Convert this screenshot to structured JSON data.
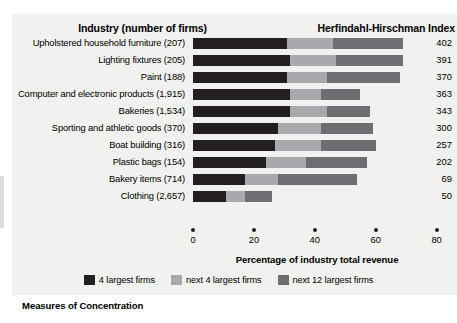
{
  "header": {
    "industry_title": "Industry (number of firms)",
    "index_title": "Herfindahl-Hirschman Index"
  },
  "caption": "Measures of Concentration",
  "axis": {
    "title": "Percentage of industry total revenue",
    "ticks": [
      "0",
      "20",
      "40",
      "60",
      "80"
    ]
  },
  "legend": [
    {
      "label": "4 largest firms",
      "color": "#231f20"
    },
    {
      "label": "next 4 largest firms",
      "color": "#a7a9ac"
    },
    {
      "label": "next 12 largest firms",
      "color": "#6d6e71"
    }
  ],
  "rows": [
    {
      "label": "Upholstered household furniture  (207)",
      "hhi": "402"
    },
    {
      "label": "Lighting fixtures  (205)",
      "hhi": "391"
    },
    {
      "label": "Paint  (188)",
      "hhi": "370"
    },
    {
      "label": "Computer and electronic products  (1,915)",
      "hhi": "363"
    },
    {
      "label": "Bakeries  (1,534)",
      "hhi": "343"
    },
    {
      "label": "Sporting and athletic goods  (370)",
      "hhi": "300"
    },
    {
      "label": "Boat building (316)",
      "hhi": "257"
    },
    {
      "label": "Plastic bags  (154)",
      "hhi": "202"
    },
    {
      "label": "Bakery items (714)",
      "hhi": "69"
    },
    {
      "label": "Clothing  (2,657)",
      "hhi": "50"
    }
  ],
  "chart_data": {
    "type": "bar",
    "orientation": "horizontal",
    "stacked": true,
    "title": "Measures of Concentration",
    "xlabel": "Percentage of industry total revenue",
    "ylabel": "Industry (number of firms)",
    "xlim": [
      0,
      80
    ],
    "xticks": [
      0,
      20,
      40,
      60,
      80
    ],
    "grid": false,
    "legend_position": "bottom",
    "categories": [
      "Upholstered household furniture (207)",
      "Lighting fixtures (205)",
      "Paint (188)",
      "Computer and electronic products (1,915)",
      "Bakeries (1,534)",
      "Sporting and athletic goods (370)",
      "Boat building (316)",
      "Plastic bags (154)",
      "Bakery items (714)",
      "Clothing (2,657)"
    ],
    "series": [
      {
        "name": "4 largest firms",
        "color": "#231f20",
        "values": [
          31,
          32,
          31,
          32,
          32,
          28,
          27,
          24,
          17,
          11
        ]
      },
      {
        "name": "next 4 largest firms",
        "color": "#a7a9ac",
        "values": [
          15,
          15,
          13,
          10,
          12,
          14,
          15,
          13,
          11,
          6
        ]
      },
      {
        "name": "next 12 largest firms",
        "color": "#6d6e71",
        "values": [
          23,
          22,
          24,
          13,
          14,
          17,
          18,
          20,
          26,
          9
        ]
      }
    ],
    "annotations": {
      "right_axis_label": "Herfindahl-Hirschman Index",
      "right_axis_values": [
        402,
        391,
        370,
        363,
        343,
        300,
        257,
        202,
        69,
        50
      ]
    }
  }
}
